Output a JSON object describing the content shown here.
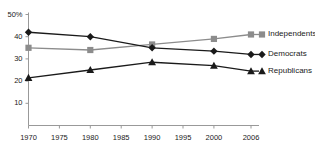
{
  "chart_data": {
    "type": "line",
    "title": "",
    "xlabel": "",
    "ylabel": "",
    "x": [
      1970,
      1980,
      1990,
      2000,
      2006
    ],
    "xticks": [
      "1970",
      "1975",
      "1980",
      "1985",
      "1990",
      "1995",
      "2000",
      "2006"
    ],
    "xtick_values": [
      1970,
      1975,
      1980,
      1985,
      1990,
      1995,
      2000,
      2006
    ],
    "yticks": [
      "10",
      "20",
      "30",
      "40",
      "50%"
    ],
    "ytick_values": [
      10,
      20,
      30,
      40,
      50
    ],
    "xlim": [
      1970,
      2006
    ],
    "ylim": [
      0,
      50
    ],
    "grid": false,
    "legend_position": "right-inline",
    "series": [
      {
        "name": "Independents",
        "values": [
          35,
          34,
          36.5,
          39,
          41
        ],
        "color": "#8c8c8c",
        "marker": "square"
      },
      {
        "name": "Democrats",
        "values": [
          42,
          40,
          35,
          33.5,
          32
        ],
        "color": "#1a1a1a",
        "marker": "diamond"
      },
      {
        "name": "Republicans",
        "values": [
          21.5,
          25,
          28.5,
          27,
          24.5
        ],
        "color": "#1a1a1a",
        "marker": "triangle"
      }
    ]
  },
  "axes": {
    "axis_color": "#999999",
    "y_top_label": "50%"
  },
  "legend": {
    "entries": [
      {
        "label": "Independents",
        "marker": "square",
        "color": "#8c8c8c"
      },
      {
        "label": "Democrats",
        "marker": "diamond",
        "color": "#1a1a1a"
      },
      {
        "label": "Republicans",
        "marker": "triangle",
        "color": "#1a1a1a"
      }
    ]
  }
}
